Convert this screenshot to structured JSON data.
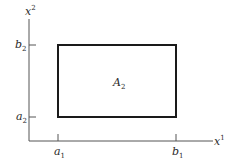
{
  "diagram": {
    "axes": {
      "y_label": {
        "base": "x",
        "sup": "2"
      },
      "x_label": {
        "base": "x",
        "sup": "1"
      }
    },
    "ticks": {
      "b2": {
        "base": "b",
        "sub": "2"
      },
      "a2": {
        "base": "a",
        "sub": "2"
      },
      "a1": {
        "base": "a",
        "sub": "1"
      },
      "b1": {
        "base": "b",
        "sub": "1"
      }
    },
    "region_label": {
      "base": "A",
      "sub": "2"
    },
    "colors": {
      "axis": "#555555",
      "rect": "#1a1a1a",
      "text": "#2a2a2a"
    }
  }
}
